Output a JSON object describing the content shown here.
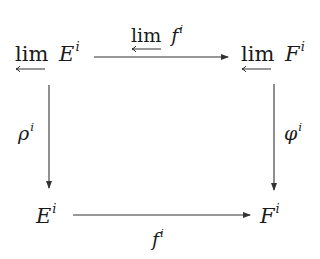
{
  "diagram": {
    "type": "commutative-square",
    "nodes": {
      "top_left": {
        "operator": "lim",
        "operator_marker": "leftarrow-under",
        "symbol": "E",
        "superscript": "i"
      },
      "top_right": {
        "operator": "lim",
        "operator_marker": "leftarrow-under",
        "symbol": "F",
        "superscript": "i"
      },
      "bottom_left": {
        "symbol": "E",
        "superscript": "i"
      },
      "bottom_right": {
        "symbol": "F",
        "superscript": "i"
      }
    },
    "edges": {
      "top": {
        "from": "top_left",
        "to": "top_right",
        "label_operator": "lim",
        "label_symbol": "f",
        "label_superscript": "i",
        "label_position": "above"
      },
      "left": {
        "from": "top_left",
        "to": "bottom_left",
        "label_symbol": "ρ",
        "label_superscript": "i",
        "label_position": "left"
      },
      "right": {
        "from": "top_right",
        "to": "bottom_right",
        "label_symbol": "φ",
        "label_superscript": "i",
        "label_position": "right"
      },
      "bottom": {
        "from": "bottom_left",
        "to": "bottom_right",
        "label_symbol": "f",
        "label_superscript": "i",
        "label_position": "below"
      }
    },
    "colors": {
      "ink": "#1a1a1a",
      "arrow": "#333333",
      "background": "#ffffff"
    }
  }
}
